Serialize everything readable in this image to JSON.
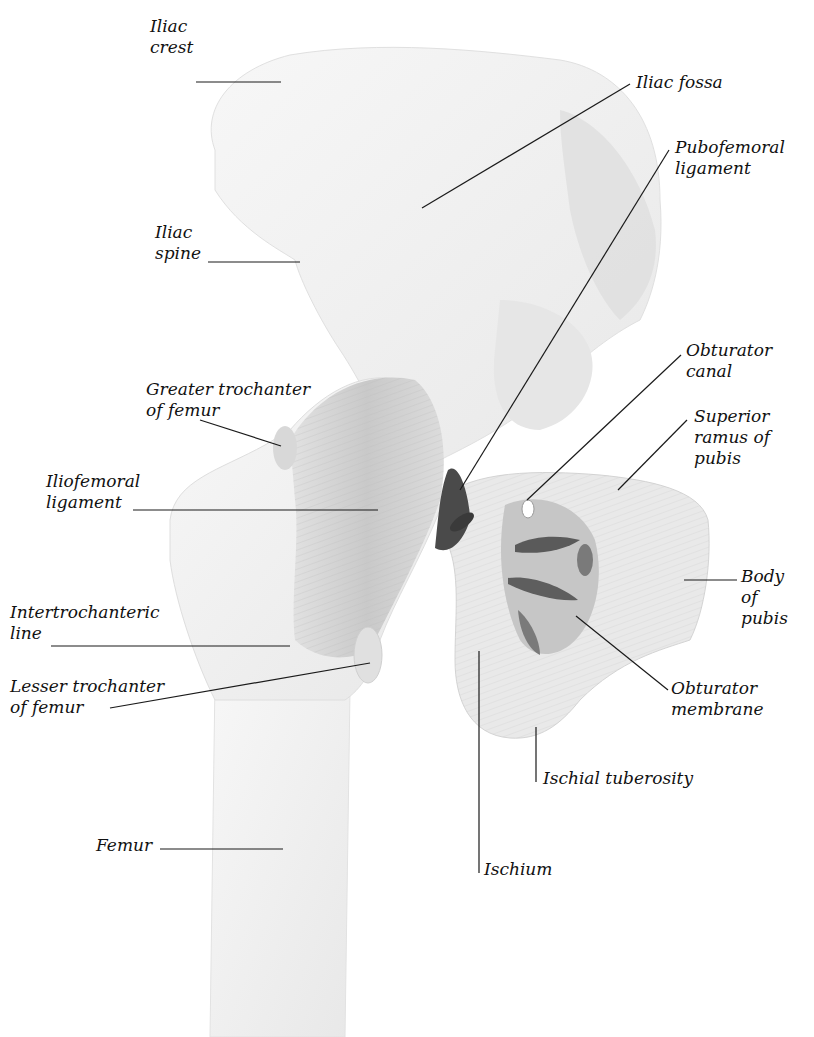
{
  "figure": {
    "colors": {
      "bone": "#f4f4f4",
      "ligament": "#d6d6d6",
      "shadow": "#6a6a6a",
      "text": "#111111",
      "leader": "#1a1a1a"
    },
    "labels": [
      {
        "id": "iliac-crest",
        "text": "Iliac\ncrest",
        "x": 150,
        "y": 16
      },
      {
        "id": "iliac-fossa",
        "text": "Iliac fossa",
        "x": 636,
        "y": 16
      },
      {
        "id": "pubofemoral-ligament",
        "text": "Pubofemoral\nligament",
        "x": 675,
        "y": 137
      },
      {
        "id": "iliac-spine",
        "text": "Iliac\nspine",
        "x": 155,
        "y": 222
      },
      {
        "id": "obturator-canal",
        "text": "Obturator\ncanal",
        "x": 686,
        "y": 340
      },
      {
        "id": "greater-trochanter",
        "text": "Greater trochanter\nof femur",
        "x": 146,
        "y": 379
      },
      {
        "id": "superior-ramus-of-pubis",
        "text": "Superior\nramus of\npubis",
        "x": 694,
        "y": 406
      },
      {
        "id": "iliofemoral-ligament",
        "text": "Iliofemoral\nligament",
        "x": 46,
        "y": 471
      },
      {
        "id": "body-of-pubis",
        "text": "Body\nof\npubis",
        "x": 741,
        "y": 566
      },
      {
        "id": "intertrochanteric-line",
        "text": "Intertrochanteric\nline",
        "x": 10,
        "y": 602
      },
      {
        "id": "lesser-trochanter",
        "text": "Lesser trochanter\nof femur",
        "x": 10,
        "y": 676
      },
      {
        "id": "obturator-membrane",
        "text": "Obturator\nmembrane",
        "x": 671,
        "y": 678
      },
      {
        "id": "ischial-tuberosity",
        "text": "Ischial tuberosity",
        "x": 543,
        "y": 768
      },
      {
        "id": "femur",
        "text": "Femur",
        "x": 96,
        "y": 835
      },
      {
        "id": "ischium",
        "text": "Ischium",
        "x": 484,
        "y": 859
      }
    ]
  }
}
